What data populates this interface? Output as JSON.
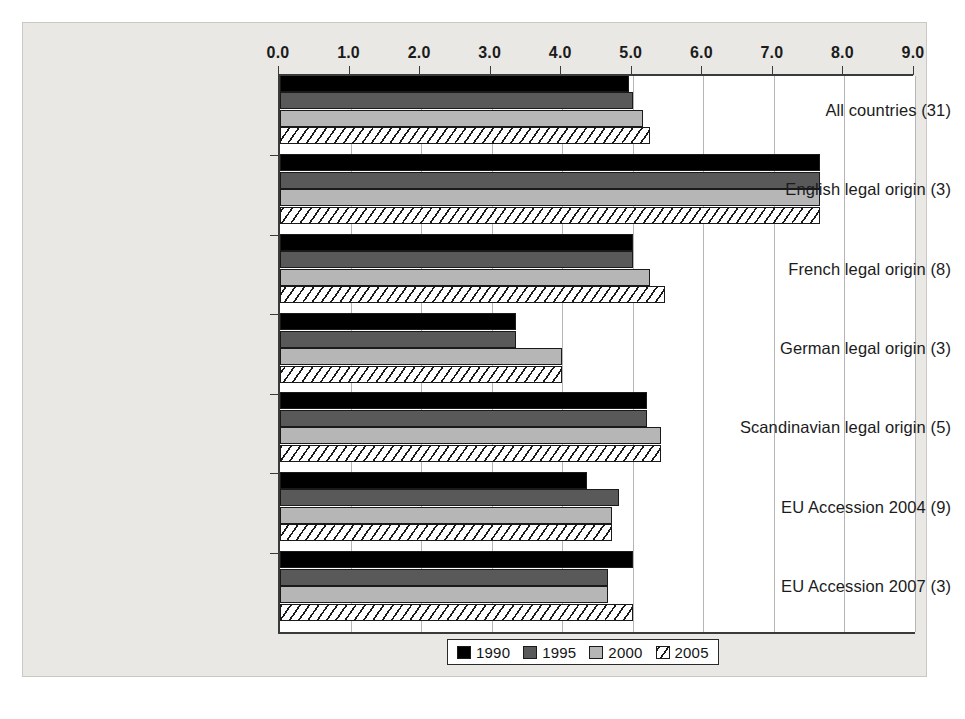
{
  "chart_data": {
    "type": "bar",
    "orientation": "horizontal",
    "title": "",
    "xlabel": "",
    "ylabel": "",
    "xlim": [
      0,
      9
    ],
    "xticks": [
      "0.0",
      "1.0",
      "2.0",
      "3.0",
      "4.0",
      "5.0",
      "6.0",
      "7.0",
      "8.0",
      "9.0"
    ],
    "grid": true,
    "legend_position": "bottom",
    "categories": [
      "All countries (31)",
      "English legal origin (3)",
      "French legal origin (8)",
      "German legal origin (3)",
      "Scandinavian legal origin (5)",
      "EU Accession 2004 (9)",
      "EU Accession 2007 (3)"
    ],
    "series": [
      {
        "name": "1990",
        "color": "#000000",
        "pattern": "solid",
        "values": [
          4.95,
          7.65,
          5.0,
          3.35,
          5.2,
          4.35,
          5.0
        ]
      },
      {
        "name": "1995",
        "color": "#595959",
        "pattern": "solid",
        "values": [
          5.0,
          7.65,
          5.0,
          3.35,
          5.2,
          4.8,
          4.65
        ]
      },
      {
        "name": "2000",
        "color": "#b6b6b6",
        "pattern": "solid",
        "values": [
          5.15,
          7.65,
          5.25,
          4.0,
          5.4,
          4.7,
          4.65
        ]
      },
      {
        "name": "2005",
        "color": "#ffffff",
        "pattern": "diagonal-hatch",
        "values": [
          5.25,
          7.65,
          5.45,
          4.0,
          5.4,
          4.7,
          5.0
        ]
      }
    ]
  },
  "legend": {
    "items": [
      {
        "label": "1990",
        "swatch": "swatch-1990"
      },
      {
        "label": "1995",
        "swatch": "swatch-1995"
      },
      {
        "label": "2000",
        "swatch": "swatch-2000"
      },
      {
        "label": "2005",
        "swatch": "swatch-2005"
      }
    ]
  }
}
